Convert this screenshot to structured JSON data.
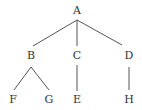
{
  "diagram": {
    "type": "tree",
    "nodes": [
      {
        "id": "A",
        "label": "A",
        "x": 77,
        "y": 10
      },
      {
        "id": "B",
        "label": "B",
        "x": 31,
        "y": 55
      },
      {
        "id": "C",
        "label": "C",
        "x": 77,
        "y": 55
      },
      {
        "id": "D",
        "label": "D",
        "x": 129,
        "y": 55
      },
      {
        "id": "F",
        "label": "F",
        "x": 13,
        "y": 99
      },
      {
        "id": "G",
        "label": "G",
        "x": 49,
        "y": 99
      },
      {
        "id": "E",
        "label": "E",
        "x": 77,
        "y": 99
      },
      {
        "id": "H",
        "label": "H",
        "x": 129,
        "y": 99
      }
    ],
    "edges": [
      {
        "from": "A",
        "to": "B"
      },
      {
        "from": "A",
        "to": "C"
      },
      {
        "from": "A",
        "to": "D"
      },
      {
        "from": "B",
        "to": "F"
      },
      {
        "from": "B",
        "to": "G"
      },
      {
        "from": "C",
        "to": "E"
      },
      {
        "from": "D",
        "to": "H"
      }
    ]
  }
}
